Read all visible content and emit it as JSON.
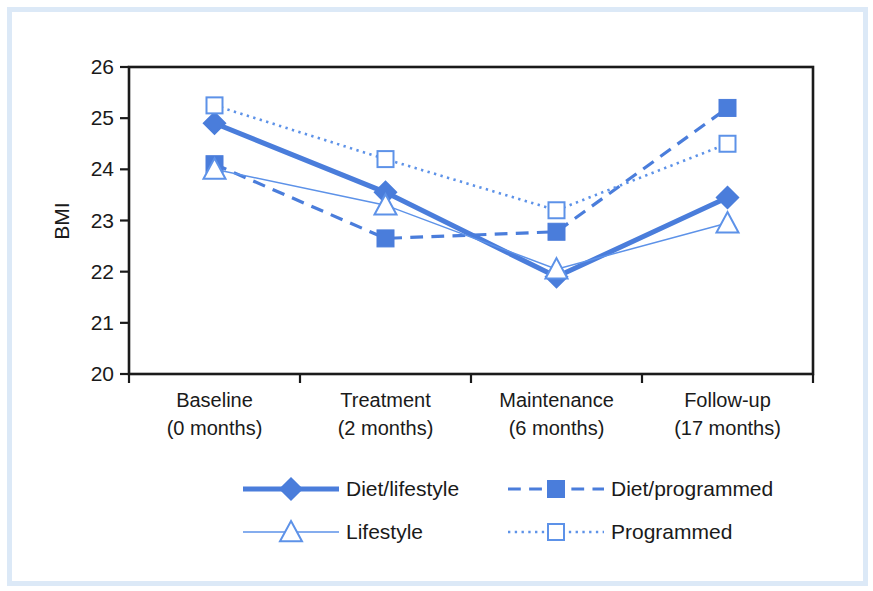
{
  "chart_data": {
    "type": "line",
    "title": "",
    "subtitle": "",
    "xlabel": "",
    "ylabel": "BMI",
    "ylim": [
      20,
      26
    ],
    "yticks": [
      20,
      21,
      22,
      23,
      24,
      25,
      26
    ],
    "ytick_labels": [
      "20",
      "21",
      "22",
      "23",
      "24",
      "25",
      "26"
    ],
    "grid": false,
    "legend_position": "bottom",
    "categories": [
      "Baseline\n(0 months)",
      "Treatment\n(2 months)",
      "Maintenance\n(6 months)",
      "Follow-up\n(17 months)"
    ],
    "category_lines": [
      [
        "Baseline",
        "(0 months)"
      ],
      [
        "Treatment",
        "(2 months)"
      ],
      [
        "Maintenance",
        "(6 months)"
      ],
      [
        "Follow-up",
        "(17 months)"
      ]
    ],
    "series": [
      {
        "name": "Diet/lifestyle",
        "values": [
          24.9,
          23.55,
          21.9,
          23.45
        ],
        "color": "#4a7ddb",
        "marker": "filled-diamond",
        "line_style": "solid",
        "line_width": 5
      },
      {
        "name": "Diet/programmed",
        "values": [
          24.1,
          22.65,
          22.78,
          25.2
        ],
        "color": "#4a7ddb",
        "marker": "filled-square",
        "line_style": "dashed",
        "line_width": 3.2
      },
      {
        "name": "Lifestyle",
        "values": [
          24.0,
          23.3,
          22.05,
          22.95
        ],
        "color": "#5d92e8",
        "marker": "open-triangle",
        "line_style": "solid",
        "line_width": 1.5
      },
      {
        "name": "Programmed",
        "values": [
          25.25,
          24.2,
          23.2,
          24.5
        ],
        "color": "#5d92e8",
        "marker": "open-square",
        "line_style": "dotted",
        "line_width": 2.6
      }
    ]
  },
  "legend": {
    "entries": [
      {
        "label": "Diet/lifestyle",
        "marker": "filled-diamond",
        "line_style": "solid",
        "color": "#4a7ddb"
      },
      {
        "label": "Diet/programmed",
        "marker": "filled-square",
        "line_style": "dashed",
        "color": "#4a7ddb"
      },
      {
        "label": "Lifestyle",
        "marker": "open-triangle",
        "line_style": "solid",
        "color": "#5d92e8"
      },
      {
        "label": "Programmed",
        "marker": "open-square",
        "line_style": "dotted",
        "color": "#5d92e8"
      }
    ]
  },
  "colors": {
    "accent_dark": "#4a7ddb",
    "accent_light": "#5d92e8",
    "axis": "#1a1a1a",
    "frame_border": "#dce9f7",
    "background": "#ffffff"
  }
}
